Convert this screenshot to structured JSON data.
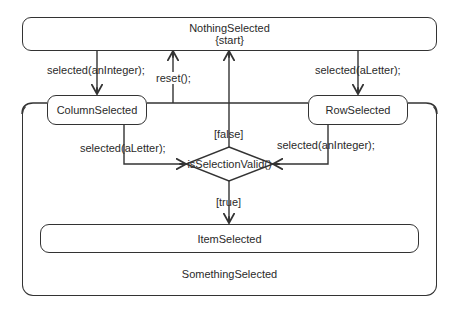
{
  "diagram": {
    "type": "UML state diagram",
    "states": {
      "nothing_selected": {
        "name": "NothingSelected",
        "tag": "{start}"
      },
      "something_selected": {
        "name": "SomethingSelected"
      },
      "column_selected": {
        "name": "ColumnSelected"
      },
      "row_selected": {
        "name": "RowSelected"
      },
      "item_selected": {
        "name": "ItemSelected"
      }
    },
    "decision": {
      "label": "isSelectionValid()",
      "guard_false": "[false]",
      "guard_true": "[true]"
    },
    "transitions": {
      "nothing_to_column": "selected(anInteger);",
      "nothing_to_row": "selected(aLetter);",
      "something_to_nothing": "reset();",
      "column_to_decision": "selected(aLetter);",
      "row_to_decision": "selected(anInteger);"
    },
    "colors": {
      "line": "#333333",
      "background": "#ffffff",
      "text": "#2a2a2a"
    }
  }
}
